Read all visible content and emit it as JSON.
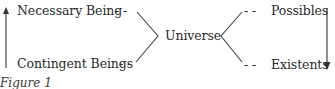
{
  "diagram": {
    "center": {
      "label": "Universe"
    },
    "left_group": {
      "top": {
        "label": "Necessary Being",
        "connector": "- -"
      },
      "bottom": {
        "label": "Contingent Beings",
        "connector": "- -"
      },
      "arrow_direction": "up"
    },
    "right_group": {
      "top": {
        "label": "Possibles",
        "connector": "- -"
      },
      "bottom": {
        "label": "Existents",
        "connector": "- -"
      },
      "arrow_direction": "down"
    },
    "caption": "Figure 1",
    "colors": {
      "text": "#2a2a2a",
      "lines": "#444444",
      "background": "#ffffff"
    }
  }
}
